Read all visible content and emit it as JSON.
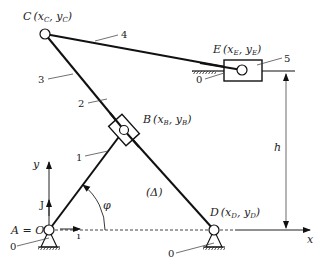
{
  "diagram": {
    "type": "planar mechanism (linkage)",
    "points": {
      "A": {
        "label": "A = O",
        "xy": [
          49,
          230
        ]
      },
      "B": {
        "label": "B",
        "coords": "(x_B, y_B)",
        "xy": [
          124,
          130
        ]
      },
      "C": {
        "label": "C",
        "coords": "(x_C, y_C)",
        "xy": [
          45,
          34
        ]
      },
      "D": {
        "label": "D",
        "coords": "(x_D, y_D)",
        "xy": [
          214,
          230
        ]
      },
      "E": {
        "label": "E",
        "coords": "(x_E, y_E)",
        "xy": [
          242,
          70
        ]
      }
    },
    "links": [
      {
        "id": "1",
        "from": "A",
        "to": "B"
      },
      {
        "id": "2",
        "name": "slider at B"
      },
      {
        "id": "3",
        "from": "C",
        "to": "B"
      },
      {
        "id": "4",
        "from": "C",
        "to": "E"
      },
      {
        "id": "5",
        "name": "slider at E"
      }
    ],
    "ground_label": "0",
    "line_label": "(Δ)",
    "angle_label": "φ",
    "height_label": "h",
    "axes": {
      "x": "x",
      "y": "y",
      "i": "ı",
      "j": "J"
    }
  },
  "labels": {
    "C_main": "C",
    "C_coords": "(x",
    "C_sub": "C",
    "C_mid": ", y",
    "C_end": ")",
    "E_main": "E",
    "E_coords": "(x",
    "E_sub": "E",
    "E_mid": ", y",
    "E_end": ")",
    "B_main": "B",
    "D_main": "D",
    "AO": "A = O",
    "link1": "1",
    "link2": "2",
    "link3": "3",
    "link4": "4",
    "link5": "5",
    "ground0_a": "0",
    "ground0_e": "0",
    "ground0_d": "0",
    "delta": "(Δ)",
    "phi": "φ",
    "h": "h",
    "x_axis": "x",
    "y_axis": "y",
    "i_vec": "ı",
    "j_vec": "J"
  }
}
